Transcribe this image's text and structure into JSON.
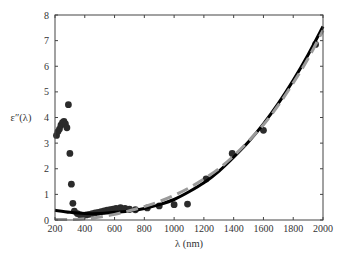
{
  "chart_data": {
    "type": "scatter",
    "title": "",
    "xlabel": "λ (nm)",
    "ylabel": "ε″(λ)",
    "xlim": [
      200,
      2000
    ],
    "ylim": [
      0,
      8
    ],
    "grid": false,
    "legend": null,
    "xticks": [
      200,
      400,
      600,
      800,
      1000,
      1200,
      1400,
      1600,
      1800,
      2000
    ],
    "yticks": [
      0,
      1,
      2,
      3,
      4,
      5,
      6,
      7,
      8
    ],
    "series": [
      {
        "name": "measured data",
        "style": "markers",
        "color": "#2b2b2b",
        "x": [
          210,
          220,
          230,
          240,
          250,
          260,
          270,
          280,
          290,
          300,
          310,
          320,
          330,
          350,
          370,
          390,
          410,
          430,
          450,
          470,
          490,
          510,
          530,
          550,
          570,
          590,
          610,
          640,
          670,
          700,
          740,
          820,
          900,
          1000,
          1090,
          1215,
          1390,
          1600,
          1950
        ],
        "y": [
          3.3,
          3.45,
          3.55,
          3.7,
          3.8,
          3.85,
          3.75,
          3.6,
          4.5,
          2.6,
          1.4,
          0.65,
          0.35,
          0.25,
          0.2,
          0.18,
          0.2,
          0.22,
          0.25,
          0.28,
          0.3,
          0.33,
          0.36,
          0.38,
          0.4,
          0.42,
          0.45,
          0.48,
          0.45,
          0.42,
          0.4,
          0.47,
          0.55,
          0.6,
          0.62,
          1.6,
          2.6,
          3.5,
          6.85
        ]
      },
      {
        "name": "model fit (solid)",
        "style": "solid",
        "color": "#000000",
        "x": [
          200,
          300,
          400,
          500,
          600,
          700,
          800,
          900,
          1000,
          1100,
          1200,
          1300,
          1400,
          1500,
          1600,
          1700,
          1800,
          1900,
          2000
        ],
        "y": [
          0.38,
          0.3,
          0.25,
          0.25,
          0.3,
          0.35,
          0.45,
          0.6,
          0.8,
          1.1,
          1.45,
          1.9,
          2.45,
          3.05,
          3.75,
          4.55,
          5.45,
          6.45,
          7.55
        ]
      },
      {
        "name": "model fit (dashed)",
        "style": "dashed",
        "color": "#9a9a9a",
        "x": [
          200,
          300,
          400,
          500,
          600,
          700,
          800,
          900,
          1000,
          1100,
          1200,
          1300,
          1400,
          1500,
          1600,
          1700,
          1800,
          1900,
          2000
        ],
        "y": [
          0.02,
          0.02,
          0.05,
          0.12,
          0.22,
          0.36,
          0.52,
          0.72,
          0.96,
          1.25,
          1.6,
          2.0,
          2.5,
          3.08,
          3.72,
          4.48,
          5.35,
          6.3,
          7.4
        ]
      }
    ]
  }
}
